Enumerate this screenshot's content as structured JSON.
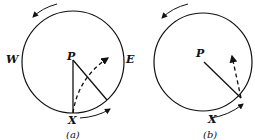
{
  "figure_a": {
    "caption": "(a)",
    "labels": {
      "west": "W",
      "east": "E",
      "center": "P",
      "point": "X"
    }
  },
  "figure_b": {
    "caption": "(b)",
    "labels": {
      "center": "P",
      "point": "X"
    }
  },
  "colors": {
    "stroke": "#111111",
    "background": "#ffffff"
  }
}
